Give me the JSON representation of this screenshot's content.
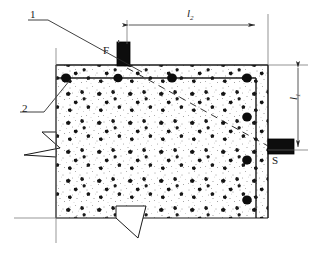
{
  "diagram": {
    "labels": {
      "callout_1": "1",
      "callout_2": "2",
      "transmitter": "F",
      "receiver": "S",
      "dim_horizontal_base": "l",
      "dim_horizontal_sub": "2",
      "dim_vertical_base": "l",
      "dim_vertical_sub": "1"
    },
    "annotations": [
      {
        "name": "callout-1",
        "text": "1",
        "meaning": "concrete cover layer"
      },
      {
        "name": "callout-2",
        "text": "2",
        "meaning": "reinforcing bar"
      },
      {
        "name": "transmitter-block",
        "text": "F",
        "meaning": "emitting transducer"
      },
      {
        "name": "receiver-block",
        "text": "S",
        "meaning": "receiving transducer"
      },
      {
        "name": "dimension-l2",
        "text": "l2",
        "meaning": "horizontal spacing"
      },
      {
        "name": "dimension-l1",
        "text": "l1",
        "meaning": "vertical spacing"
      }
    ],
    "colors": {
      "ink": "#1a1a1a",
      "rule": "#555555",
      "concrete_fill": "#ffffff",
      "aggregate": "#111111",
      "block_fill": "#0d0d0d"
    },
    "geometry": {
      "body_left": 56,
      "body_right": 268,
      "body_top": 65,
      "body_bottom": 218,
      "cover_top_y": 78,
      "cover_right_x": 256,
      "dim_l2_from_x": 127,
      "dim_l2_to_x": 257,
      "dim_l1_from_y": 65,
      "dim_l1_to_y": 150
    },
    "rebar_top": [
      {
        "x": 66,
        "y": 78
      },
      {
        "x": 118,
        "y": 78
      },
      {
        "x": 172,
        "y": 78
      },
      {
        "x": 247,
        "y": 78
      }
    ],
    "rebar_right": [
      {
        "x": 247,
        "y": 78
      },
      {
        "x": 247,
        "y": 117
      },
      {
        "x": 247,
        "y": 160
      },
      {
        "x": 247,
        "y": 200
      }
    ]
  }
}
